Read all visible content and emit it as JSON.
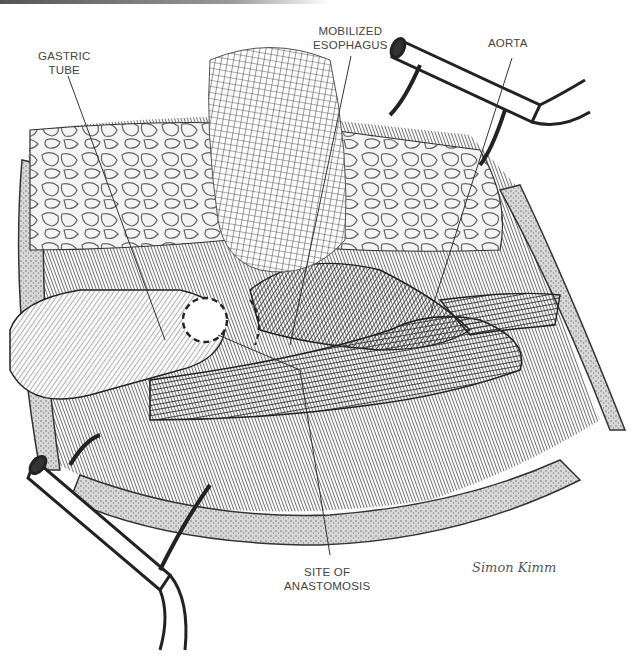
{
  "figure": {
    "type": "surgical-illustration",
    "labels": {
      "gastric_tube": [
        "GASTRIC",
        "TUBE"
      ],
      "mobilized_esophagus": [
        "MOBILIZED",
        "ESOPHAGUS"
      ],
      "aorta": [
        "AORTA"
      ],
      "site_of_anastomosis": [
        "SITE OF",
        "ANASTOMOSIS"
      ]
    },
    "signature": "Simon Kimm"
  }
}
